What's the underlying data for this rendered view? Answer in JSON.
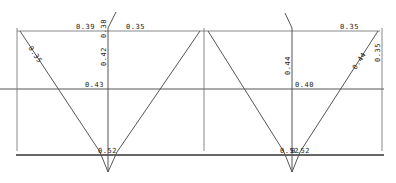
{
  "diagram": {
    "type": "twin V-groove dimension drawing",
    "panels": [
      {
        "id": "left",
        "labels": {
          "top_left": "0.39",
          "top_right": "0.35",
          "center_vertical_upper": "0.38",
          "center_vertical_lower": "0.42",
          "left_diagonal": "0.35",
          "middle": "0.43",
          "bottom_tip": "0.52"
        }
      },
      {
        "id": "right",
        "labels": {
          "top_right": "0.35",
          "center_vertical": "0.44",
          "right_diagonal": "0.44",
          "right_vertical": "0.35",
          "middle": "0.40",
          "bottom_tip": "0.52"
        }
      }
    ],
    "line_color": "#555555",
    "text_color": "#222222"
  }
}
